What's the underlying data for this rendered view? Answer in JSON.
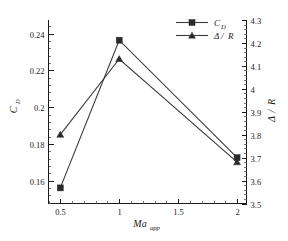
{
  "chart_data": {
    "type": "line",
    "title": "",
    "xlabel": "Ma_app",
    "xlabel_base": "Ma",
    "xlabel_sub": "app",
    "x": [
      0.5,
      1,
      2
    ],
    "xlim": [
      0.4,
      2.08
    ],
    "xticks": [
      0.5,
      1,
      1.5,
      2
    ],
    "xticklabels": [
      "0.5",
      "1",
      "1.5",
      "2"
    ],
    "x_minor_count": 4,
    "grid": false,
    "legend_position": "top-right",
    "left_axis": {
      "label": "C_D",
      "label_base": "C",
      "label_sub": "D",
      "ylim": [
        0.1475,
        0.2475
      ],
      "yticks": [
        0.16,
        0.18,
        0.2,
        0.22,
        0.24
      ],
      "yticklabels": [
        "0.16",
        "0.18",
        "0.2",
        "0.22",
        "0.24"
      ],
      "minor_count": 4
    },
    "right_axis": {
      "label": "Δ/R",
      "label_base": "Δ",
      "label_sep": "/",
      "label_sub": "R",
      "ylim": [
        3.5,
        4.3
      ],
      "yticks": [
        3.5,
        3.6,
        3.7,
        3.8,
        3.9,
        4.0,
        4.1,
        4.2,
        4.3
      ],
      "yticklabels": [
        "3.5",
        "3.6",
        "3.7",
        "3.8",
        "3.9",
        "4",
        "4.1",
        "4.2",
        "4.3"
      ],
      "minor_count": 4
    },
    "series": [
      {
        "name": "C_D",
        "name_base": "C",
        "name_sub": "D",
        "axis": "left",
        "marker": "square",
        "color": "#2b2b2b",
        "line_color": "#3a3a3a",
        "values": [
          0.156,
          0.2365,
          0.1725
        ]
      },
      {
        "name": "Δ/R",
        "name_base": "Δ",
        "name_sep": "/",
        "name_sub": "R",
        "axis": "right",
        "marker": "triangle",
        "color": "#2b2b2b",
        "line_color": "#3a3a3a",
        "values": [
          3.8,
          4.13,
          3.68
        ]
      }
    ]
  },
  "legend": {
    "entries": [
      {
        "label_base": "C",
        "label_sub": "D",
        "marker": "square"
      },
      {
        "label_base": "Δ",
        "label_sep": "/",
        "label_sub": "R",
        "marker": "triangle"
      }
    ]
  },
  "colors": {
    "background": "#ffffff",
    "axis": "#1a1a1a",
    "series_cd": "#2b2b2b",
    "series_delta_r": "#2b2b2b",
    "line": "#3a3a3a"
  }
}
